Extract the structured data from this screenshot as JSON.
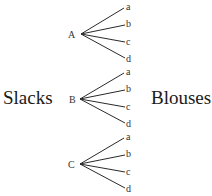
{
  "diagram": {
    "type": "tree-diagram",
    "left_label": "Slacks",
    "right_label": "Blouses",
    "line_color": "#2a2a2a",
    "text_color": "#333333",
    "groups": [
      {
        "label": "A",
        "branches": [
          "a",
          "b",
          "c",
          "d"
        ]
      },
      {
        "label": "B",
        "branches": [
          "a",
          "b",
          "c",
          "d"
        ]
      },
      {
        "label": "C",
        "branches": [
          "a",
          "b",
          "c",
          "d"
        ]
      }
    ]
  }
}
